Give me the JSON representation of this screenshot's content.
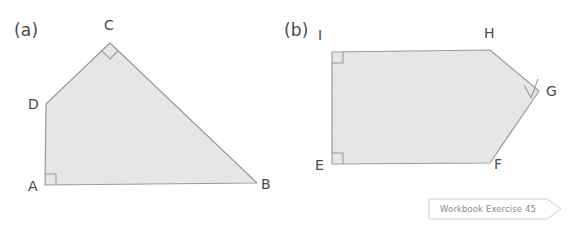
{
  "page": {
    "background_color": "#ffffff"
  },
  "style": {
    "shape_fill": "#e6e6e6",
    "shape_stroke": "#9a9a9a",
    "marker_stroke": "#9a9a9a",
    "label_color": "#4a4a4a",
    "banner_border": "#cccccc",
    "banner_text_color": "#8a8a8a"
  },
  "figures": [
    {
      "id": "figure-a",
      "part_label": "(a)",
      "shape": "quadrilateral",
      "vertices": [
        {
          "name": "A",
          "x": 45,
          "y": 185,
          "label_x": 28,
          "label_y": 178,
          "right_angle": true,
          "marker_type": "square"
        },
        {
          "name": "B",
          "x": 257,
          "y": 183,
          "label_x": 261,
          "label_y": 176,
          "right_angle": false,
          "marker_type": "none"
        },
        {
          "name": "C",
          "x": 110,
          "y": 43,
          "label_x": 104,
          "label_y": 17,
          "right_angle": true,
          "marker_type": "diamond"
        },
        {
          "name": "D",
          "x": 46,
          "y": 104,
          "label_x": 28,
          "label_y": 96,
          "right_angle": false,
          "marker_type": "none"
        }
      ],
      "outline_order": [
        "A",
        "D",
        "C",
        "B"
      ]
    },
    {
      "id": "figure-b",
      "part_label": "(b)",
      "shape": "pentagon",
      "vertices": [
        {
          "name": "E",
          "x": 332,
          "y": 164,
          "label_x": 315,
          "label_y": 157,
          "right_angle": true,
          "marker_type": "square"
        },
        {
          "name": "F",
          "x": 490,
          "y": 163,
          "label_x": 494,
          "label_y": 156,
          "right_angle": false,
          "marker_type": "none"
        },
        {
          "name": "G",
          "x": 539,
          "y": 91,
          "label_x": 546,
          "label_y": 83,
          "right_angle": true,
          "marker_type": "diamond"
        },
        {
          "name": "H",
          "x": 490,
          "y": 50,
          "label_x": 484,
          "label_y": 25,
          "right_angle": false,
          "marker_type": "none"
        },
        {
          "name": "I",
          "x": 332,
          "y": 52,
          "label_x": 318,
          "label_y": 27,
          "right_angle": true,
          "marker_type": "square"
        }
      ],
      "outline_order": [
        "E",
        "F",
        "G",
        "H",
        "I"
      ]
    }
  ],
  "banner": {
    "text": "Workbook Exercise 45"
  }
}
